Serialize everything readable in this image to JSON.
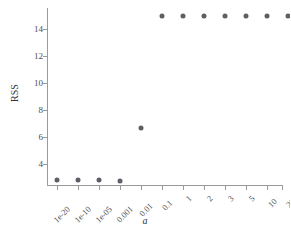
{
  "chart_data": {
    "type": "scatter",
    "title": "",
    "xlabel": "a",
    "ylabel": "RSS",
    "categories": [
      "1e-20",
      "1e-10",
      "1e-05",
      "0.001",
      "0.01",
      "0.1",
      "1",
      "2",
      "3",
      "5",
      "10",
      "20"
    ],
    "values": [
      2.8,
      2.8,
      2.8,
      2.75,
      6.7,
      15.0,
      15.0,
      15.0,
      15.0,
      15.0,
      15.0,
      15.0
    ],
    "series": [
      {
        "name": "RSS",
        "values": [
          2.8,
          2.8,
          2.8,
          2.75,
          6.7,
          15.0,
          15.0,
          15.0,
          15.0,
          15.0,
          15.0,
          15.0
        ]
      }
    ],
    "ytick_labels": [
      "4",
      "6",
      "8",
      "10",
      "12",
      "14"
    ],
    "ytick_values": [
      4,
      6,
      8,
      10,
      12,
      14
    ],
    "ylim": [
      2.4,
      15.4
    ],
    "xlim": [
      -0.5,
      11.5
    ],
    "grid": false,
    "legend": false,
    "point_color": "#5e5e66",
    "axis_color": "#9a9a9a",
    "background": "#ffffff"
  }
}
